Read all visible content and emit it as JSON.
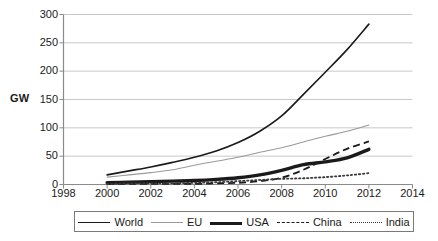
{
  "chart_data": {
    "type": "line",
    "title": "",
    "subtitle": "",
    "xlabel": "",
    "ylabel": "GW",
    "xlim": [
      1998,
      2014
    ],
    "ylim": [
      0,
      300
    ],
    "grid": true,
    "legend_position": "bottom",
    "x_ticks": [
      "1998",
      "2000",
      "2002",
      "2004",
      "2006",
      "2008",
      "2010",
      "2012",
      "2014"
    ],
    "y_ticks": [
      "0",
      "50",
      "100",
      "150",
      "200",
      "250",
      "300"
    ],
    "x": [
      2000,
      2001,
      2002,
      2003,
      2004,
      2005,
      2006,
      2007,
      2008,
      2009,
      2010,
      2011,
      2012
    ],
    "series": [
      {
        "name": "World",
        "style": "solid",
        "color": "#1a1a1a",
        "width": 1.6,
        "values": [
          17,
          24,
          31,
          39,
          48,
          59,
          74,
          94,
          121,
          159,
          198,
          238,
          283
        ]
      },
      {
        "name": "EU",
        "style": "solid",
        "color": "#9a9a9a",
        "width": 1.1,
        "values": [
          13,
          17,
          21,
          26,
          34,
          41,
          48,
          57,
          65,
          75,
          85,
          94,
          105
        ]
      },
      {
        "name": "USA",
        "style": "solid",
        "color": "#1a1a1a",
        "width": 3.4,
        "values": [
          3,
          4,
          5,
          6,
          7,
          9,
          12,
          17,
          25,
          35,
          40,
          47,
          62
        ]
      },
      {
        "name": "China",
        "style": "dashed",
        "color": "#1a1a1a",
        "width": 1.8,
        "values": [
          1,
          1,
          1,
          1,
          1,
          2,
          3,
          6,
          12,
          26,
          45,
          63,
          76
        ]
      },
      {
        "name": "India",
        "style": "dotted",
        "color": "#3a3a3a",
        "width": 1.8,
        "values": [
          1,
          2,
          2,
          2,
          3,
          4,
          6,
          8,
          10,
          11,
          13,
          16,
          20
        ]
      }
    ]
  },
  "legend": {
    "items": [
      {
        "label": "World",
        "swatch": "line-solid-medium-icon"
      },
      {
        "label": "EU",
        "swatch": "line-solid-thin-gray-icon"
      },
      {
        "label": "USA",
        "swatch": "line-solid-thick-icon"
      },
      {
        "label": "China",
        "swatch": "line-dashed-icon"
      },
      {
        "label": "India",
        "swatch": "line-dotted-icon"
      }
    ]
  },
  "colors": {
    "grid": "#c8c8c8",
    "axis": "#8a8a8a",
    "text": "#1a1a1a",
    "background": "#ffffff"
  }
}
